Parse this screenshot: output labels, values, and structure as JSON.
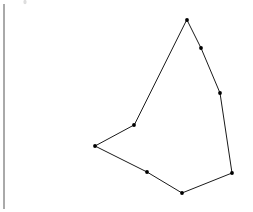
{
  "figure": {
    "kind": "line-drawing",
    "canvas": {
      "width": 253,
      "height": 212
    },
    "background_color": "#ffffff",
    "stroke_color": "#1a1a1a",
    "vertex_color": "#000000",
    "stroke_width": 1,
    "vertex_radius": 1.9,
    "closed": true,
    "vertex_count": 8,
    "vertices": [
      {
        "label": "apex-top",
        "x": 187,
        "y": 20
      },
      {
        "label": "right-upper",
        "x": 201,
        "y": 48
      },
      {
        "label": "right-middle",
        "x": 220,
        "y": 93
      },
      {
        "label": "bottom-right",
        "x": 232,
        "y": 173
      },
      {
        "label": "bottom-center",
        "x": 182,
        "y": 193
      },
      {
        "label": "bottom-left-mid",
        "x": 147,
        "y": 172
      },
      {
        "label": "left-corner",
        "x": 95,
        "y": 146
      },
      {
        "label": "upper-left-notch",
        "x": 134,
        "y": 125
      }
    ]
  },
  "margin_rule": {
    "label": "page-margin-line",
    "color": "#555555",
    "x": 4,
    "y_start": 4,
    "y_end": 209
  },
  "artifacts": [
    {
      "label": "scan-speck",
      "x": 25,
      "y": 2,
      "rx": 1.6,
      "ry": 2.2,
      "color": "#dedede"
    }
  ]
}
